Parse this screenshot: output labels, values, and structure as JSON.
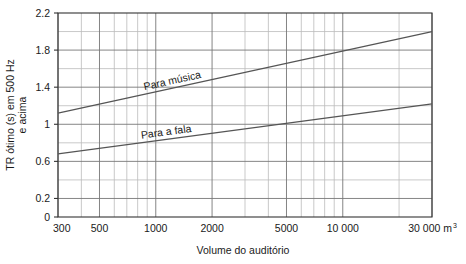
{
  "chart_data": {
    "type": "line",
    "title": "",
    "xlabel": "Volume do auditório",
    "ylabel_line1": "TR ótimo (s) em 500 Hz",
    "ylabel_line2": "e acima",
    "x_unit": "m",
    "x_unit_exponent": "3",
    "x_scale": "log",
    "xlim": [
      300,
      30000
    ],
    "ylim": [
      0,
      2.2
    ],
    "grid": true,
    "legend_position": "inline-labels",
    "x_tick_labels": [
      "300",
      "500",
      "1000",
      "2000",
      "5000",
      "10 000",
      "30 000 m"
    ],
    "x_tick_values": [
      300,
      500,
      1000,
      2000,
      5000,
      10000,
      30000
    ],
    "x_minor_gridlines": [
      400,
      600,
      700,
      800,
      900,
      3000,
      4000,
      6000,
      7000,
      8000,
      9000,
      20000
    ],
    "y_tick_labels": [
      "0",
      "0.2",
      "0.6",
      "1",
      "1.4",
      "1.8",
      "2.2"
    ],
    "y_tick_values": [
      0,
      0.2,
      0.6,
      1,
      1.4,
      1.8,
      2.2
    ],
    "y_minor_gridlines": [
      0.4,
      0.8,
      1.2,
      1.6,
      2.0
    ],
    "series": [
      {
        "name": "Para música",
        "label": "Para música",
        "color": "#555555",
        "x": [
          300,
          30000
        ],
        "values": [
          1.12,
          2.0
        ]
      },
      {
        "name": "Para a fala",
        "label": "Para a fala",
        "color": "#555555",
        "x": [
          300,
          30000
        ],
        "values": [
          0.68,
          1.22
        ]
      }
    ],
    "colors": {
      "axis": "#333333",
      "gridline_major": "#777777",
      "gridline_minor": "#bbbbbb",
      "curve": "#555555",
      "background": "#ffffff"
    }
  }
}
